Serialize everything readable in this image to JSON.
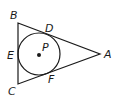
{
  "diagram": {
    "type": "triangle-with-inscribed-circle",
    "stroke_color": "#1a1a1a",
    "background": "#ffffff",
    "vertices": [
      {
        "name": "A",
        "label": "A",
        "x": 100,
        "y": 54
      },
      {
        "name": "B",
        "label": "B",
        "x": 18,
        "y": 23
      },
      {
        "name": "C",
        "label": "C",
        "x": 18,
        "y": 84
      }
    ],
    "circle": {
      "center_label": "P",
      "cx": 39,
      "cy": 54,
      "r": 21
    },
    "tangent_points": [
      {
        "name": "D",
        "label": "D",
        "on_side": "AB"
      },
      {
        "name": "E",
        "label": "E",
        "on_side": "BC"
      },
      {
        "name": "F",
        "label": "F",
        "on_side": "AC"
      }
    ],
    "labels": {
      "A": "A",
      "B": "B",
      "C": "C",
      "D": "D",
      "E": "E",
      "F": "F",
      "P": "P"
    }
  }
}
